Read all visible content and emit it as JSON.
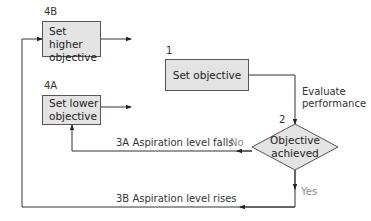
{
  "diagram": {
    "type": "flowchart",
    "nodes": [
      {
        "id": "4B",
        "step_label": "4B",
        "text_lines": [
          "Set higher",
          "objective"
        ],
        "shape": "rectangle"
      },
      {
        "id": "1",
        "step_label": "1",
        "text_lines": [
          "Set objective"
        ],
        "shape": "rectangle"
      },
      {
        "id": "4A",
        "step_label": "4A",
        "text_lines": [
          "Set lower",
          "objective"
        ],
        "shape": "rectangle"
      },
      {
        "id": "2",
        "step_label": "2",
        "text_lines": [
          "Objective",
          "achieved"
        ],
        "shape": "diamond"
      }
    ],
    "edges": [
      {
        "from": "1",
        "to": "2",
        "label_lines": [
          "Evaluate",
          "performance"
        ]
      },
      {
        "from": "2",
        "to": "4A",
        "branch": "No",
        "label": "3A  Aspiration level falls"
      },
      {
        "from": "2",
        "to": "4B",
        "branch": "Yes",
        "label": "3B  Aspiration level rises"
      },
      {
        "from": "4B",
        "to": "1",
        "label": ""
      },
      {
        "from": "4A",
        "to": "1",
        "label": ""
      }
    ]
  },
  "labels": {
    "n4b_step": "4B",
    "n4b_line1": "Set higher",
    "n4b_line2": "objective",
    "n1_step": "1",
    "n1_text": "Set objective",
    "n4a_step": "4A",
    "n4a_line1": "Set lower",
    "n4a_line2": "objective",
    "n2_step": "2",
    "n2_line1": "Objective",
    "n2_line2": "achieved",
    "evaluate_line1": "Evaluate",
    "evaluate_line2": "performance",
    "edge_3a": "3A  Aspiration level falls",
    "edge_3b": "3B  Aspiration level rises",
    "branch_no": "No",
    "branch_yes": "Yes"
  },
  "colors": {
    "box_fill": "#e3e3e3",
    "line": "#333333",
    "branch_text": "#8a8a8a"
  }
}
